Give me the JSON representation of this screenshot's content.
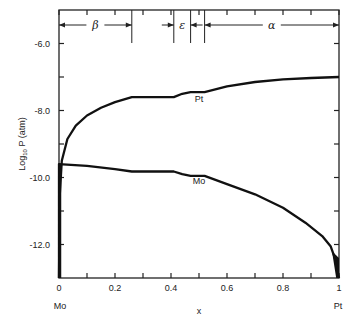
{
  "chart_data": {
    "type": "line",
    "title": "",
    "xlabel": "x",
    "ylabel": "Log10 P (atm)",
    "ylabel_main": "Log",
    "ylabel_sub": "10",
    "ylabel_rest": " P  (atm)",
    "xlim": [
      0,
      1
    ],
    "ylim": [
      -13,
      -5
    ],
    "x_ticks": [
      0,
      0.1,
      0.2,
      0.3,
      0.4,
      0.5,
      0.6,
      0.7,
      0.8,
      0.9,
      1
    ],
    "x_tick_labels": [
      {
        "x": 0,
        "label": "0"
      },
      {
        "x": 0.2,
        "label": "0.2"
      },
      {
        "x": 0.4,
        "label": "0.4"
      },
      {
        "x": 0.6,
        "label": "0.6"
      },
      {
        "x": 0.8,
        "label": "0.8"
      },
      {
        "x": 1,
        "label": "1"
      }
    ],
    "y_ticks": [
      -6,
      -7,
      -8,
      -9,
      -10,
      -11,
      -12
    ],
    "y_tick_labels": [
      {
        "y": -6,
        "label": "-6.0"
      },
      {
        "y": -8,
        "label": "-8.0"
      },
      {
        "y": -10,
        "label": "-10.0"
      },
      {
        "y": -12,
        "label": "-12.0"
      }
    ],
    "x_end_labels": {
      "left": "Mo",
      "right": "Pt"
    },
    "grid": false,
    "series": [
      {
        "name": "Pt",
        "label_at": {
          "x": 0.5,
          "y": -7.75
        },
        "points": [
          [
            0.0,
            -13.0
          ],
          [
            0.003,
            -10.5
          ],
          [
            0.01,
            -9.5
          ],
          [
            0.03,
            -8.85
          ],
          [
            0.06,
            -8.45
          ],
          [
            0.1,
            -8.15
          ],
          [
            0.15,
            -7.92
          ],
          [
            0.2,
            -7.75
          ],
          [
            0.26,
            -7.6
          ],
          [
            0.41,
            -7.6
          ],
          [
            0.44,
            -7.5
          ],
          [
            0.47,
            -7.45
          ],
          [
            0.52,
            -7.45
          ],
          [
            0.6,
            -7.28
          ],
          [
            0.7,
            -7.15
          ],
          [
            0.8,
            -7.07
          ],
          [
            0.9,
            -7.03
          ],
          [
            1.0,
            -7.0
          ]
        ]
      },
      {
        "name": "Mo",
        "label_at": {
          "x": 0.5,
          "y": -10.2
        },
        "points": [
          [
            0.0,
            -13.0
          ],
          [
            0.0,
            -9.6
          ],
          [
            0.1,
            -9.65
          ],
          [
            0.2,
            -9.75
          ],
          [
            0.26,
            -9.82
          ],
          [
            0.41,
            -9.82
          ],
          [
            0.44,
            -9.9
          ],
          [
            0.47,
            -9.95
          ],
          [
            0.52,
            -9.95
          ],
          [
            0.6,
            -10.2
          ],
          [
            0.7,
            -10.5
          ],
          [
            0.8,
            -10.9
          ],
          [
            0.88,
            -11.35
          ],
          [
            0.94,
            -11.75
          ],
          [
            0.97,
            -12.05
          ],
          [
            0.985,
            -12.4
          ],
          [
            1.0,
            -13.0
          ]
        ]
      }
    ],
    "phase_regions": [
      {
        "name": "beta",
        "symbol": "β",
        "from": 0.0,
        "to": 0.26
      },
      {
        "name": "epsilon",
        "symbol": "ε",
        "from": 0.41,
        "to": 0.47
      },
      {
        "name": "alpha",
        "symbol": "α",
        "from": 0.52,
        "to": 1.0
      }
    ],
    "phase_boundaries": [
      0.26,
      0.41,
      0.47,
      0.52
    ]
  }
}
